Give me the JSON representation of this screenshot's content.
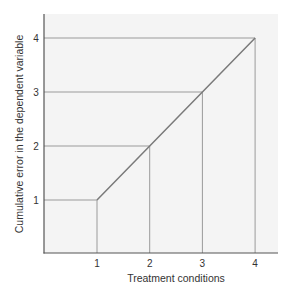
{
  "chart_data": {
    "type": "line",
    "title": "",
    "xlabel": "Treatment conditions",
    "ylabel": "Cumulative error in the dependent variable",
    "x": [
      1,
      2,
      3,
      4
    ],
    "series": [
      {
        "name": "Cumulative error",
        "values": [
          1,
          2,
          3,
          4
        ]
      }
    ],
    "x_ticks": [
      "1",
      "2",
      "3",
      "4"
    ],
    "y_ticks": [
      "1",
      "2",
      "3",
      "4"
    ],
    "xlim": [
      0,
      4.4
    ],
    "ylim": [
      0,
      4.4
    ],
    "grid": false,
    "reference_lines": "horizontal and vertical drop lines from each point to the axes",
    "legend": "none"
  },
  "colors": {
    "plot_background": "#f4f4f4",
    "axis": "#555555",
    "data_line": "#7a7a7a",
    "reference_lines": "#9a9a9a",
    "text": "#333333"
  }
}
